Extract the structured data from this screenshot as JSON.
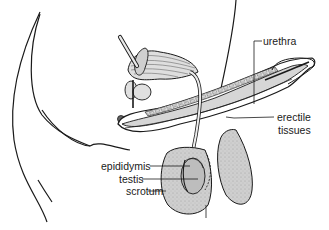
{
  "diagram": {
    "labels": {
      "urethra": "urethra",
      "erectile_line1": "erectile",
      "erectile_line2": "tissues",
      "epididymis": "epididymis",
      "testis": "testis",
      "scrotum": "scrotum"
    },
    "colors": {
      "outline": "#1a1a1a",
      "tissue_fill": "#d6d6d6",
      "testis_fill": "#bdbdbd",
      "scrotum_fill": "#c9c9c9",
      "background": "#ffffff"
    }
  }
}
